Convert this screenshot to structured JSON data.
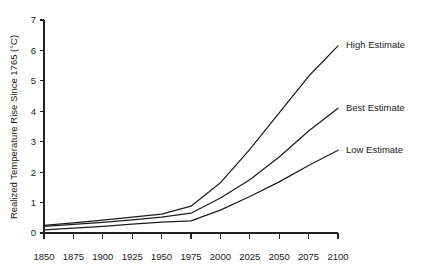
{
  "chart_data": {
    "type": "line",
    "title": "",
    "xlabel": "",
    "ylabel": "Realized Temperature Rise Since 1765 (°C)",
    "x": [
      1850,
      1875,
      1900,
      1925,
      1950,
      1975,
      2000,
      2025,
      2050,
      2075,
      2100
    ],
    "xlim": [
      1850,
      2100
    ],
    "ylim": [
      0,
      7
    ],
    "xticks": [
      "1850",
      "1875",
      "1900",
      "1925",
      "1950",
      "1975",
      "2000",
      "2025",
      "2050",
      "2075",
      "2100"
    ],
    "yticks": [
      "0",
      "1",
      "2",
      "3",
      "4",
      "5",
      "6",
      "7"
    ],
    "grid": false,
    "legend_position": "inline-right",
    "series": [
      {
        "name": "High Estimate",
        "label": "High Estimate",
        "color": "#1d1d1d",
        "values": [
          0.25,
          0.33,
          0.42,
          0.52,
          0.62,
          0.88,
          1.65,
          2.75,
          3.95,
          5.15,
          6.15
        ]
      },
      {
        "name": "Best Estimate",
        "label": "Best Estimate",
        "color": "#1d1d1d",
        "values": [
          0.22,
          0.28,
          0.35,
          0.43,
          0.52,
          0.65,
          1.15,
          1.75,
          2.5,
          3.35,
          4.1
        ]
      },
      {
        "name": "Low Estimate",
        "label": "Low Estimate",
        "color": "#1d1d1d",
        "values": [
          0.1,
          0.16,
          0.22,
          0.29,
          0.36,
          0.4,
          0.75,
          1.2,
          1.68,
          2.22,
          2.72
        ]
      }
    ]
  }
}
